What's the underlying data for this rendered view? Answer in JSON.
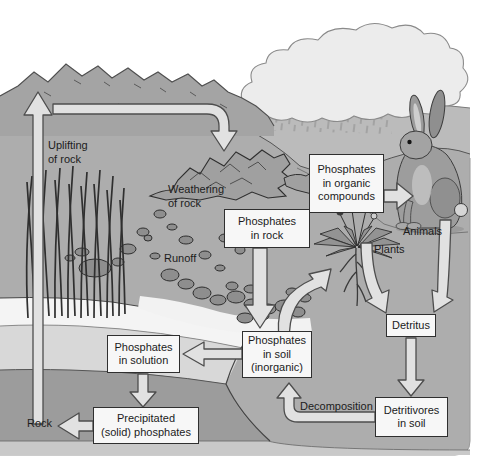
{
  "diagram": {
    "labels": {
      "uplifting": "Uplifting\nof rock",
      "weathering": "Weathering\nof rock",
      "runoff": "Runoff",
      "phosphates_in_rock": "Phosphates\nin rock",
      "phosphates_in_organic": "Phosphates\nin organic\ncompounds",
      "animals": "Animals",
      "plants": "Plants",
      "phosphates_in_soil": "Phosphates\nin soil\n(inorganic)",
      "phosphates_in_solution": "Phosphates\nin solution",
      "precipitated": "Precipitated\n(solid) phosphates",
      "rock": "Rock",
      "decomposition": "Decomposition",
      "detritus": "Detritus",
      "detritivores": "Detritivores\nin soil"
    },
    "palette": {
      "background": "#ffffff",
      "ground": "#adadad",
      "mountains": "#a4a4a4",
      "far_hills": "#bbbbbb",
      "cloud": "#ececec",
      "water": "#d8d8d8",
      "water_surface": "#f4f4f4",
      "sediment_dark": "#9c9c9c",
      "sediment_light": "#c9c9c9",
      "box_fill": "#f7f7f7",
      "box_border": "#2f2f2f",
      "arrow_fill": "#e1e1e1",
      "arrow_outline": "#4d4d4d",
      "text": "#1b1b1b"
    }
  }
}
